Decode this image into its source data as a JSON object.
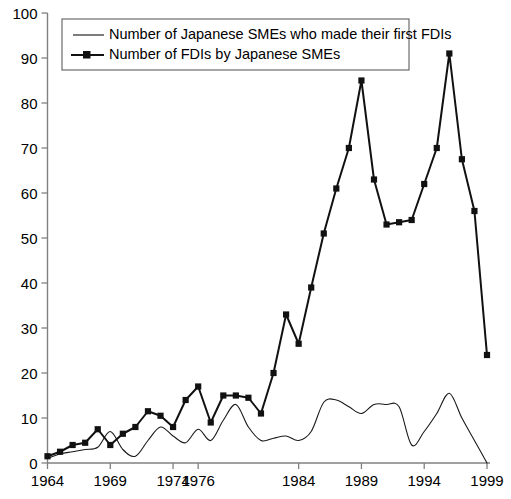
{
  "chart_data": {
    "type": "line",
    "title": "",
    "xlabel": "",
    "ylabel": "",
    "ylim": [
      0,
      100
    ],
    "yticks": [
      0,
      10,
      20,
      30,
      40,
      50,
      60,
      70,
      80,
      90,
      100
    ],
    "xticks": [
      "1964",
      "1969",
      "1974",
      "1976",
      "1984",
      "1989",
      "1994",
      "1999"
    ],
    "xtick_values": [
      1964,
      1969,
      1974,
      1976,
      1984,
      1989,
      1994,
      1999
    ],
    "xlim": [
      1964,
      1999
    ],
    "grid": false,
    "legend_position": "top-left",
    "x": [
      1964,
      1965,
      1966,
      1967,
      1968,
      1969,
      1970,
      1971,
      1972,
      1973,
      1974,
      1975,
      1976,
      1977,
      1978,
      1979,
      1980,
      1981,
      1982,
      1983,
      1984,
      1985,
      1986,
      1987,
      1988,
      1989,
      1990,
      1991,
      1992,
      1993,
      1994,
      1995,
      1996,
      1997,
      1998,
      1999
    ],
    "series": [
      {
        "name": "Number of Japanese SMEs who made their first FDIs",
        "style": "thin-line",
        "marker": "none",
        "color": "#1a1a1a",
        "values": [
          1,
          2,
          2.5,
          3,
          3.5,
          7,
          3,
          1.5,
          5,
          8,
          6,
          4.5,
          7.5,
          5,
          9.5,
          13,
          8,
          5,
          5.5,
          6,
          5,
          7,
          13.5,
          14,
          12.5,
          11,
          13,
          13,
          12.5,
          4,
          7,
          11,
          15.5,
          10,
          5,
          0
        ]
      },
      {
        "name": "Number of FDIs by Japanese SMEs",
        "style": "thick-line",
        "marker": "square",
        "color": "#111111",
        "values": [
          1.5,
          2.5,
          4,
          4.5,
          7.5,
          4,
          6.5,
          8,
          11.5,
          10.5,
          8,
          14,
          17,
          9,
          15,
          15,
          14.5,
          11,
          20,
          33,
          26.5,
          39,
          51,
          61,
          70,
          85,
          63,
          53,
          53.5,
          54,
          62,
          70,
          91,
          67.5,
          56,
          24
        ]
      }
    ],
    "annotations": {
      "peak_1": {
        "year": 1989,
        "value": 85
      },
      "peak_2": {
        "year": 1996,
        "value": 91
      },
      "final": {
        "year": 1999,
        "value": 24
      }
    }
  },
  "legend": {
    "entries": [
      {
        "label": "Number of Japanese SMEs who made their first FDIs",
        "swatch": "plain-line-swatch"
      },
      {
        "label": "Number of FDIs by Japanese SMEs",
        "swatch": "line-with-square-marker-swatch"
      }
    ]
  },
  "axes": {
    "y_tick_labels": [
      "100",
      "90",
      "80",
      "70",
      "60",
      "50",
      "40",
      "30",
      "20",
      "10",
      "0"
    ],
    "x_tick_labels": [
      "1964",
      "1969",
      "1974",
      "1976",
      "1984",
      "1989",
      "1994",
      "1999"
    ]
  },
  "colors": {
    "series_thin": "#1a1a1a",
    "series_thick": "#111111",
    "axis": "#808080",
    "legend_border": "#6b6b6b",
    "background": "#ffffff"
  }
}
